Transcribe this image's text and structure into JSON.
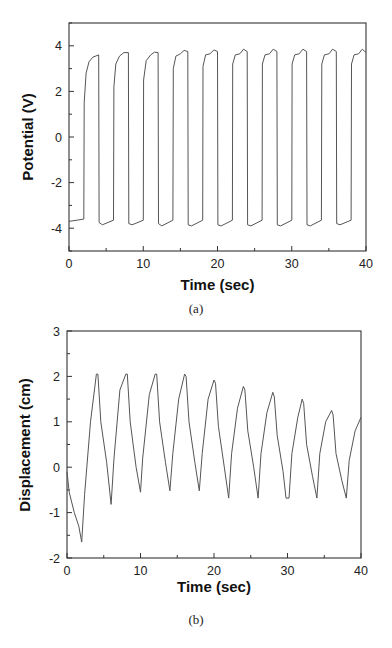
{
  "chart_data": [
    {
      "id": "a",
      "type": "line",
      "caption": "(a)",
      "xlabel": "Time (sec)",
      "ylabel": "Potential (V)",
      "xlim": [
        0,
        40
      ],
      "ylim": [
        -5,
        5
      ],
      "xticks": [
        0,
        10,
        20,
        30,
        40
      ],
      "yticks": [
        -4,
        -2,
        0,
        2,
        4
      ],
      "grid": false,
      "legend": null,
      "series": [
        {
          "name": "Potential",
          "color": "#555555",
          "x": [
            0,
            2,
            2.05,
            2.3,
            2.7,
            3.2,
            4.0,
            4.05,
            4.5,
            6.0,
            6.05,
            6.3,
            6.8,
            7.4,
            8.0,
            8.05,
            8.5,
            10.0,
            10.05,
            10.4,
            11.0,
            11.5,
            12.0,
            12.05,
            12.5,
            14.0,
            14.05,
            14.4,
            15.0,
            15.5,
            16.0,
            16.05,
            16.5,
            18.0,
            18.05,
            18.4,
            19.0,
            19.5,
            20.0,
            20.05,
            20.5,
            22.0,
            22.05,
            22.4,
            23.0,
            23.5,
            24.0,
            24.05,
            24.5,
            26.0,
            26.05,
            26.4,
            27.0,
            27.5,
            28.0,
            28.05,
            28.5,
            30.0,
            30.05,
            30.4,
            31.0,
            31.5,
            32.0,
            32.05,
            32.5,
            34.0,
            34.05,
            34.4,
            35.0,
            35.5,
            36.0,
            36.05,
            36.5,
            38.0,
            38.05,
            38.4,
            39.0,
            39.5,
            40.0
          ],
          "y": [
            -3.7,
            -3.6,
            1.5,
            2.8,
            3.3,
            3.5,
            3.6,
            -3.75,
            -3.85,
            -3.65,
            2.2,
            3.2,
            3.55,
            3.7,
            3.7,
            -3.8,
            -3.85,
            -3.65,
            2.5,
            3.35,
            3.6,
            3.72,
            3.7,
            -3.8,
            -3.9,
            -3.65,
            3.0,
            3.55,
            3.65,
            3.8,
            3.75,
            -3.85,
            -3.9,
            -3.65,
            3.1,
            3.6,
            3.65,
            3.82,
            3.75,
            -3.85,
            -3.9,
            -3.65,
            3.2,
            3.6,
            3.65,
            3.85,
            3.75,
            -3.85,
            -3.9,
            -3.65,
            3.2,
            3.6,
            3.65,
            3.85,
            3.75,
            -3.85,
            -3.9,
            -3.65,
            3.2,
            3.6,
            3.65,
            3.85,
            3.75,
            -3.85,
            -3.9,
            -3.65,
            3.2,
            3.6,
            3.65,
            3.85,
            3.75,
            -3.8,
            -3.85,
            -3.65,
            3.2,
            3.6,
            3.65,
            3.85,
            3.7
          ]
        }
      ]
    },
    {
      "id": "b",
      "type": "line",
      "caption": "(b)",
      "xlabel": "Time (sec)",
      "ylabel": "Displacement (cm)",
      "xlim": [
        0,
        40
      ],
      "ylim": [
        -2,
        3
      ],
      "xticks": [
        0,
        10,
        20,
        30,
        40
      ],
      "yticks": [
        -2,
        -1,
        0,
        1,
        2,
        3
      ],
      "grid": false,
      "legend": null,
      "series": [
        {
          "name": "Displacement",
          "color": "#555555",
          "x": [
            0,
            0.3,
            1.0,
            1.6,
            2.0,
            2.4,
            3.2,
            4.0,
            4.2,
            4.6,
            5.4,
            6.0,
            6.4,
            7.2,
            8.0,
            8.2,
            8.6,
            9.4,
            10.0,
            10.3,
            11.2,
            12.0,
            12.2,
            12.6,
            13.4,
            14.0,
            14.4,
            15.2,
            16.0,
            16.2,
            16.6,
            17.4,
            18.0,
            18.4,
            19.2,
            20.0,
            20.2,
            20.6,
            21.4,
            22.0,
            22.4,
            23.2,
            24.0,
            24.2,
            24.6,
            25.4,
            26.0,
            26.4,
            27.2,
            28.0,
            28.2,
            28.6,
            29.4,
            29.8,
            30.2,
            30.6,
            31.4,
            32.0,
            32.2,
            32.6,
            33.4,
            34.0,
            34.4,
            35.2,
            36.0,
            36.2,
            36.6,
            37.4,
            38.0,
            38.4,
            39.2,
            40.0
          ],
          "y": [
            -0.1,
            -0.55,
            -1.0,
            -1.3,
            -1.65,
            -0.6,
            1.0,
            2.05,
            2.05,
            1.0,
            0.1,
            -0.82,
            0.2,
            1.7,
            2.05,
            2.05,
            1.0,
            0.0,
            -0.55,
            0.2,
            1.6,
            2.05,
            2.05,
            1.0,
            0.1,
            -0.52,
            0.3,
            1.5,
            2.05,
            2.0,
            1.0,
            0.1,
            -0.52,
            0.3,
            1.5,
            1.92,
            1.85,
            0.9,
            0.0,
            -0.68,
            0.3,
            1.3,
            1.78,
            1.7,
            0.8,
            0.0,
            -0.68,
            0.3,
            1.2,
            1.65,
            1.55,
            0.7,
            -0.1,
            -0.68,
            -0.68,
            0.3,
            1.1,
            1.5,
            1.4,
            0.5,
            -0.2,
            -0.68,
            0.3,
            1.0,
            1.25,
            1.15,
            0.3,
            -0.3,
            -0.68,
            0.15,
            0.8,
            1.1
          ]
        }
      ]
    }
  ]
}
